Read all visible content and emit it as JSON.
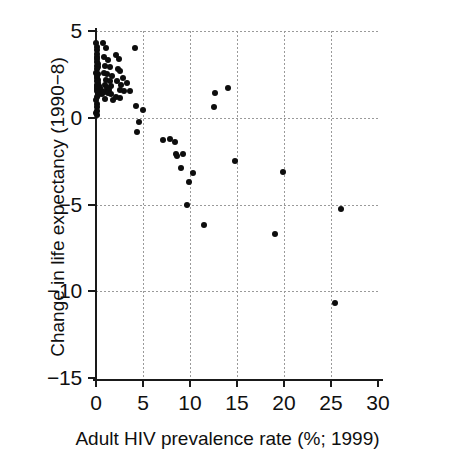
{
  "chart_data": {
    "type": "scatter",
    "title": "",
    "xlabel": "Adult HIV prevalence rate (%; 1999)",
    "ylabel": "Change in life expectancy (1990−8)",
    "xlim": [
      0,
      30
    ],
    "ylim": [
      -15,
      5
    ],
    "xticks": [
      0,
      5,
      10,
      15,
      20,
      25,
      30
    ],
    "xticklabels": [
      "0",
      "5",
      "10",
      "15",
      "20",
      "25",
      "30"
    ],
    "yticks": [
      5,
      0,
      -5,
      -10,
      -15
    ],
    "yticklabels": [
      "5",
      "0",
      "−5",
      "−10",
      "−15"
    ],
    "grid": "dotted-both-axes",
    "legend": "none",
    "marker": "filled-circle",
    "marker_color": "#0d0d0d",
    "series": [
      {
        "name": "countries",
        "points": [
          [
            0.05,
            4.3
          ],
          [
            0.08,
            4.1
          ],
          [
            0.1,
            3.9
          ],
          [
            0.12,
            3.7
          ],
          [
            0.06,
            3.5
          ],
          [
            0.15,
            3.4
          ],
          [
            0.09,
            3.2
          ],
          [
            0.18,
            3.1
          ],
          [
            0.07,
            3.0
          ],
          [
            0.2,
            2.9
          ],
          [
            0.11,
            2.8
          ],
          [
            0.05,
            2.6
          ],
          [
            0.22,
            2.5
          ],
          [
            0.14,
            2.4
          ],
          [
            0.08,
            2.3
          ],
          [
            0.25,
            2.2
          ],
          [
            0.1,
            2.1
          ],
          [
            0.16,
            2.0
          ],
          [
            0.06,
            1.9
          ],
          [
            0.3,
            1.85
          ],
          [
            0.12,
            1.8
          ],
          [
            0.2,
            1.75
          ],
          [
            0.4,
            1.7
          ],
          [
            0.09,
            1.65
          ],
          [
            0.55,
            1.6
          ],
          [
            0.15,
            1.55
          ],
          [
            0.35,
            1.5
          ],
          [
            0.25,
            1.45
          ],
          [
            0.45,
            1.4
          ],
          [
            0.6,
            1.35
          ],
          [
            0.18,
            1.3
          ],
          [
            0.08,
            1.2
          ],
          [
            0.05,
            1.0
          ],
          [
            0.07,
            0.8
          ],
          [
            0.06,
            0.6
          ],
          [
            0.09,
            0.4
          ],
          [
            0.05,
            0.25
          ],
          [
            0.1,
            0.15
          ],
          [
            0.75,
            4.3
          ],
          [
            1.1,
            4.0
          ],
          [
            0.85,
            3.5
          ],
          [
            1.3,
            3.3
          ],
          [
            1.0,
            3.0
          ],
          [
            1.5,
            2.9
          ],
          [
            0.9,
            2.6
          ],
          [
            1.2,
            2.5
          ],
          [
            1.7,
            2.4
          ],
          [
            1.05,
            2.2
          ],
          [
            1.45,
            2.1
          ],
          [
            0.95,
            1.9
          ],
          [
            1.6,
            1.85
          ],
          [
            1.15,
            1.7
          ],
          [
            1.35,
            1.6
          ],
          [
            0.8,
            1.5
          ],
          [
            1.25,
            1.45
          ],
          [
            1.55,
            1.35
          ],
          [
            1.0,
            1.1
          ],
          [
            1.85,
            1.05
          ],
          [
            2.1,
            3.6
          ],
          [
            2.4,
            3.4
          ],
          [
            2.3,
            2.8
          ],
          [
            2.6,
            2.7
          ],
          [
            2.9,
            2.3
          ],
          [
            2.2,
            2.1
          ],
          [
            2.7,
            1.9
          ],
          [
            2.5,
            1.6
          ],
          [
            3.0,
            1.55
          ],
          [
            2.15,
            1.2
          ],
          [
            2.55,
            1.15
          ],
          [
            3.3,
            2.0
          ],
          [
            3.6,
            1.55
          ],
          [
            4.1,
            4.0
          ],
          [
            4.3,
            0.65
          ],
          [
            5.0,
            0.45
          ],
          [
            4.6,
            -0.25
          ],
          [
            4.4,
            -0.85
          ],
          [
            7.1,
            -1.3
          ],
          [
            7.9,
            -1.25
          ],
          [
            8.4,
            -1.4
          ],
          [
            8.5,
            -2.1
          ],
          [
            8.6,
            -2.2
          ],
          [
            9.3,
            -2.1
          ],
          [
            9.0,
            -2.9
          ],
          [
            10.3,
            -3.2
          ],
          [
            9.9,
            -3.7
          ],
          [
            9.7,
            -5.0
          ],
          [
            11.5,
            -6.2
          ],
          [
            12.5,
            0.6
          ],
          [
            12.7,
            1.4
          ],
          [
            14.0,
            1.7
          ],
          [
            14.8,
            -2.5
          ],
          [
            19.0,
            -6.7
          ],
          [
            19.9,
            -3.1
          ],
          [
            25.4,
            -10.7
          ],
          [
            26.1,
            -5.25
          ]
        ]
      }
    ]
  },
  "axes": {
    "x": {
      "label": "Adult HIV prevalence rate (%; 1999)",
      "ticklabels": [
        "0",
        "5",
        "10",
        "15",
        "20",
        "25",
        "30"
      ]
    },
    "y": {
      "label": "Change in life expectancy (1990−8)",
      "ticklabels": [
        "5",
        "0",
        "−5",
        "−10",
        "−15"
      ]
    }
  }
}
